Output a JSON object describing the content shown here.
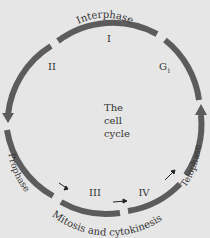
{
  "diagram": {
    "title_fragment": "y g",
    "center_label": [
      "The",
      "cell",
      "cycle"
    ],
    "arc_labels": {
      "top": "Interphase",
      "bottom": "Mitosis and cytokinesis",
      "left": "Prophase",
      "right": "Telophase"
    },
    "stage_labels": {
      "I": "I",
      "II": "II",
      "G1": "G",
      "G1_sub": "1",
      "III": "III",
      "IV": "IV"
    },
    "colors": {
      "background": "#e6e6e6",
      "stroke": "#5c5c5c",
      "text": "#333333"
    }
  }
}
